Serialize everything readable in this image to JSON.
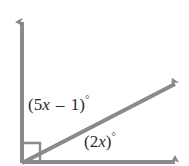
{
  "figure": {
    "kind": "geometry-angle-diagram",
    "background_color": "#ffffff",
    "ray_color": "#8a8a8a",
    "text_color": "#2b2b2b",
    "right_angle_marker": {
      "present": true,
      "name": "right-angle-square-marker",
      "implied_measure": "90"
    },
    "vertex": {
      "x": 22,
      "y": 163
    },
    "rays": [
      {
        "name": "vertical-ray",
        "direction": "up",
        "from": {
          "x": 22,
          "y": 163
        },
        "to": {
          "x": 22,
          "y": 16
        },
        "arrowhead": true
      },
      {
        "name": "diagonal-ray",
        "direction": "upper-right",
        "from": {
          "x": 22,
          "y": 163
        },
        "to": {
          "x": 183,
          "y": 78
        },
        "arrowhead": true
      },
      {
        "name": "horizontal-ray",
        "direction": "right",
        "from": {
          "x": 22,
          "y": 163
        },
        "to": {
          "x": 183,
          "y": 162
        },
        "arrowhead": true
      }
    ],
    "labels": {
      "upper_angle": {
        "name": "upper-angle-label",
        "full_text": "(5x – 1)°",
        "open_paren": "(",
        "coefficient": "5",
        "variable": "x",
        "operator": "–",
        "constant": "1",
        "close_paren": ")",
        "degree_symbol": "°",
        "between_rays": [
          "vertical-ray",
          "diagonal-ray"
        ]
      },
      "lower_angle": {
        "name": "lower-angle-label",
        "full_text": "(2x)°",
        "open_paren": "(",
        "coefficient": "2",
        "variable": "x",
        "close_paren": ")",
        "degree_symbol": "°",
        "between_rays": [
          "diagonal-ray",
          "horizontal-ray"
        ]
      }
    }
  }
}
